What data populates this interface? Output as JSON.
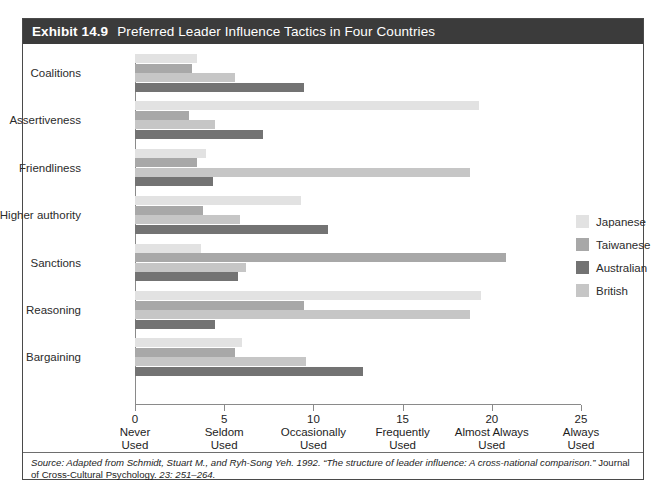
{
  "exhibit": {
    "number_label": "Exhibit 14.9",
    "title": "Preferred Leader Influence Tactics in Four Countries",
    "source_part1": "Source: Adapted from Schmidt, Stuart M., and Ryh-Song Yeh. 1992. “The structure of leader influence: A cross-national comparison.” ",
    "source_part2": "Journal of Cross-Cultural Psychology.",
    "source_part3": " 23: 251–264."
  },
  "legend": {
    "position": "right",
    "items": [
      {
        "label": "Japanese",
        "color": "#e2e2e2"
      },
      {
        "label": "Taiwanese",
        "color": "#a8a8a8"
      },
      {
        "label": "Australian",
        "color": "#737373"
      },
      {
        "label": "British",
        "color": "#c6c6c6"
      }
    ]
  },
  "axis": {
    "ticks": [
      {
        "value": 0,
        "num": "0",
        "line1": "Never",
        "line2": "Used"
      },
      {
        "value": 5,
        "num": "5",
        "line1": "Seldom",
        "line2": "Used"
      },
      {
        "value": 10,
        "num": "10",
        "line1": "Occasionally",
        "line2": "Used"
      },
      {
        "value": 15,
        "num": "15",
        "line1": "Frequently",
        "line2": "Used"
      },
      {
        "value": 20,
        "num": "20",
        "line1": "Almost Always",
        "line2": "Used"
      },
      {
        "value": 25,
        "num": "25",
        "line1": "Always",
        "line2": "Used"
      }
    ]
  },
  "chart_data": {
    "type": "bar",
    "orientation": "horizontal",
    "title": "Preferred Leader Influence Tactics in Four Countries",
    "xlabel": "",
    "ylabel": "",
    "xlim": [
      0,
      25
    ],
    "grid": false,
    "legend_position": "right",
    "xtick_values": [
      0,
      5,
      10,
      15,
      20,
      25
    ],
    "xtick_labels": [
      "0 Never Used",
      "5 Seldom Used",
      "10 Occasionally Used",
      "15 Frequently Used",
      "20 Almost Always Used",
      "25 Always Used"
    ],
    "categories": [
      "Coalitions",
      "Assertiveness",
      "Friendliness",
      "Higher authority",
      "Sanctions",
      "Reasoning",
      "Bargaining"
    ],
    "series": [
      {
        "name": "Japanese",
        "color": "#e2e2e2",
        "values": [
          3.5,
          19.3,
          4.0,
          9.3,
          3.7,
          19.4,
          6.0
        ]
      },
      {
        "name": "Taiwanese",
        "color": "#a8a8a8",
        "values": [
          3.2,
          3.0,
          3.5,
          3.8,
          20.8,
          9.5,
          5.6
        ]
      },
      {
        "name": "British",
        "color": "#c6c6c6",
        "values": [
          5.6,
          4.5,
          18.8,
          5.9,
          6.2,
          18.8,
          9.6
        ]
      },
      {
        "name": "Australian",
        "color": "#737373",
        "values": [
          9.5,
          7.2,
          4.4,
          10.8,
          5.8,
          4.5,
          12.8
        ]
      }
    ],
    "series_draw_order": [
      "Japanese",
      "Taiwanese",
      "British",
      "Australian"
    ]
  }
}
